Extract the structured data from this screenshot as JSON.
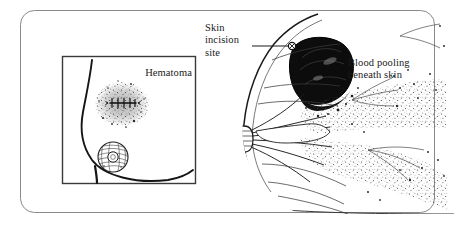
{
  "figure": {
    "kind": "medical-illustration",
    "panel": {
      "border_color": "#8a8a8a",
      "background": "#ffffff",
      "corner_radius": 14
    },
    "ink_color": "#1a1a1a",
    "blood_color": "#0d0d0d"
  },
  "inset": {
    "name": "external-view",
    "label": "Hematoma",
    "border_color": "#3a3a3a",
    "contents": [
      "breast-profile-outline",
      "stippled-bruise-patch",
      "sutured-incision-line",
      "nipple-areola"
    ]
  },
  "callouts": [
    {
      "id": "skin-incision",
      "text": "Skin\nincision\nsite",
      "leader": true
    },
    {
      "id": "blood-pooling",
      "text": "Blood pooling\nbeneath skin",
      "leader": false
    }
  ],
  "cross_section": {
    "name": "sagittal-breast-cross-section",
    "features": [
      "skin-surface",
      "subcutaneous-hematoma-mass",
      "nipple",
      "lactiferous-ducts",
      "glandular-lobules",
      "suspensory-ligaments",
      "chest-wall"
    ]
  }
}
